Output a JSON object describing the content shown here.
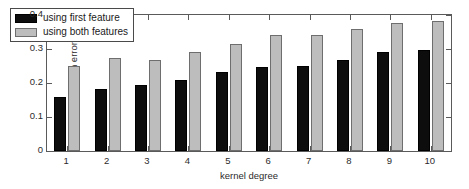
{
  "chart_data": {
    "type": "bar",
    "title": "",
    "xlabel": "kernel degree",
    "ylabel": "generalization error",
    "categories": [
      "1",
      "2",
      "3",
      "4",
      "5",
      "6",
      "7",
      "8",
      "9",
      "10"
    ],
    "series": [
      {
        "name": "using first feature",
        "color": "#0d0d0d",
        "values": [
          0.16,
          0.183,
          0.195,
          0.21,
          0.232,
          0.248,
          0.25,
          0.267,
          0.291,
          0.298
        ]
      },
      {
        "name": "using both features",
        "color": "#bdbdbd",
        "values": [
          0.25,
          0.275,
          0.268,
          0.291,
          0.315,
          0.341,
          0.34,
          0.36,
          0.377,
          0.382
        ]
      }
    ],
    "ylim": [
      0,
      0.4
    ],
    "yticks": [
      "0",
      "0.1",
      "0.2",
      "0.3",
      "0.4"
    ],
    "ytick_values": [
      0,
      0.1,
      0.2,
      0.3,
      0.4
    ],
    "grid": false,
    "legend_position": "upper left"
  }
}
